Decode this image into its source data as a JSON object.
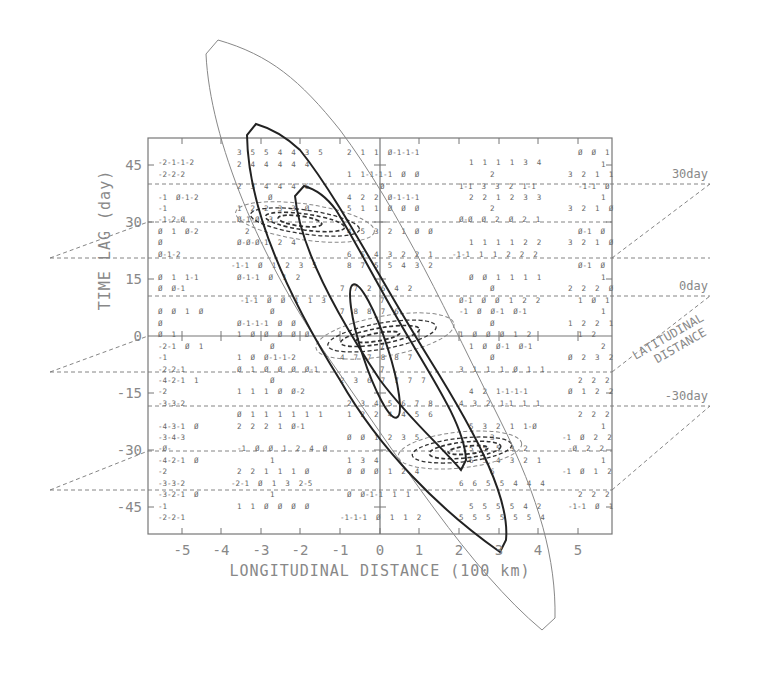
{
  "chart_data": {
    "type": "contour",
    "title": "",
    "xlabel": "LONGITUDINAL DISTANCE (100 km)",
    "ylabel": "TIME LAG (day)",
    "zlabel": "LATITUDINAL DISTANCE",
    "x_ticks": [
      "-5",
      "-4",
      "-3",
      "-2",
      "-1",
      "0",
      "1",
      "2",
      "3",
      "4",
      "5"
    ],
    "y_ticks": [
      "45",
      "30",
      "15",
      "0",
      "-15",
      "-30",
      "-45"
    ],
    "xlim": [
      -5.8,
      5.8
    ],
    "ylim": [
      -53,
      53
    ],
    "grid": false,
    "planes": [
      {
        "label": "30day",
        "time_lag": 30
      },
      {
        "label": "0day",
        "time_lag": 0
      },
      {
        "label": "-30day",
        "time_lag": -30
      }
    ],
    "contours": [
      {
        "name": "outer-thin",
        "style": "solid-thin",
        "description": "large elongated ellipse oriented from upper-left (-3.6, 80) to lower-right (3.8, -90)"
      },
      {
        "name": "middle-bold",
        "style": "solid-bold",
        "description": "bold ellipse from (-2.6, 55) to (3.0, -53)"
      },
      {
        "name": "inner-bold",
        "style": "solid-bold",
        "description": "bold ellipse from (-1.8, 36) to (2.2, -35)"
      },
      {
        "name": "core-bold",
        "style": "solid-bold",
        "description": "innermost ellipse from (-0.3, 15) to (1.0, -15)"
      },
      {
        "name": "dashed-30day",
        "style": "dashed",
        "description": "dashed concentric ellipses centered near (-1.3, 30) on 30-day plane"
      },
      {
        "name": "dashed-0day",
        "style": "dashed",
        "description": "dashed concentric ellipses centered near (0, 0) on 0-day plane"
      },
      {
        "name": "dashed-minus30day",
        "style": "dashed",
        "description": "dashed concentric ellipses centered near (1.5, -30) on -30-day plane"
      }
    ],
    "annotations": [
      {
        "x_pos": 1.8,
        "rows": [
          {
            "y": 46,
            "text": "3 5 5 4 4 3 5"
          },
          {
            "y": 42,
            "text": "2 4 4 4 4 4"
          }
        ]
      }
    ]
  },
  "labels": {
    "x_axis_title": "LONGITUDINAL DISTANCE (100 km)",
    "y_axis_title": "TIME LAG (day)",
    "z_axis_title_line1": "LATITUDINAL",
    "z_axis_title_line2": "DISTANCE",
    "plane_30": "30day",
    "plane_0": "0day",
    "plane_m30": "-30day"
  },
  "cells": [
    {
      "x": 158,
      "y": 165,
      "t": "-2-1-1-2"
    },
    {
      "x": 158,
      "y": 177,
      "t": "-2-2-2"
    },
    {
      "x": 158,
      "y": 200,
      "t": "-1  0-1-2"
    },
    {
      "x": 158,
      "y": 211,
      "t": "-1"
    },
    {
      "x": 158,
      "y": 222,
      "t": "-1-2-0"
    },
    {
      "x": 158,
      "y": 234,
      "t": "0  1  0-2"
    },
    {
      "x": 158,
      "y": 245,
      "t": "0"
    },
    {
      "x": 158,
      "y": 257,
      "t": "0-1-2"
    },
    {
      "x": 158,
      "y": 280,
      "t": "0  1  1-1"
    },
    {
      "x": 158,
      "y": 291,
      "t": "0  0-1"
    },
    {
      "x": 158,
      "y": 314,
      "t": "0  0  1  0"
    },
    {
      "x": 158,
      "y": 326,
      "t": "0"
    },
    {
      "x": 158,
      "y": 337,
      "t": "0  1"
    },
    {
      "x": 158,
      "y": 349,
      "t": "-2-1  0  1"
    },
    {
      "x": 158,
      "y": 360,
      "t": "-1"
    },
    {
      "x": 158,
      "y": 372,
      "t": "-2-2-1"
    },
    {
      "x": 158,
      "y": 383,
      "t": "-4-2-1  1"
    },
    {
      "x": 158,
      "y": 394,
      "t": "-2"
    },
    {
      "x": 158,
      "y": 406,
      "t": "-3-3-2"
    },
    {
      "x": 158,
      "y": 429,
      "t": "-4-3-1  0"
    },
    {
      "x": 158,
      "y": 440,
      "t": "-3-4-3"
    },
    {
      "x": 158,
      "y": 451,
      "t": "-0-"
    },
    {
      "x": 158,
      "y": 463,
      "t": "-4-2-1  0"
    },
    {
      "x": 158,
      "y": 474,
      "t": "-2"
    },
    {
      "x": 158,
      "y": 486,
      "t": "-3-3-2"
    },
    {
      "x": 158,
      "y": 497,
      "t": "-3-2-1  0"
    },
    {
      "x": 158,
      "y": 509,
      "t": "-1"
    },
    {
      "x": 158,
      "y": 520,
      "t": "-2-2-1"
    },
    {
      "x": 237,
      "y": 155,
      "t": "3  5  5  4  4  3  5"
    },
    {
      "x": 237,
      "y": 167,
      "t": "2  4  4  4  4  4"
    },
    {
      "x": 237,
      "y": 189,
      "t": "2  3  4  4  4  6"
    },
    {
      "x": 268,
      "y": 200,
      "t": "0"
    },
    {
      "x": 237,
      "y": 211,
      "t": "1  2  2  3  3  0"
    },
    {
      "x": 237,
      "y": 222,
      "t": "0-1-0  3"
    },
    {
      "x": 245,
      "y": 234,
      "t": "2"
    },
    {
      "x": 237,
      "y": 245,
      "t": "0-0-0-1  2  4"
    },
    {
      "x": 231,
      "y": 268,
      "t": "-1-1  0  1  2  3  5"
    },
    {
      "x": 237,
      "y": 280,
      "t": "0-1-1  0  1  2"
    },
    {
      "x": 240,
      "y": 303,
      "t": "-1-1  0  0  1  1  3"
    },
    {
      "x": 270,
      "y": 314,
      "t": "0"
    },
    {
      "x": 237,
      "y": 326,
      "t": "0-1-1-1  0  0"
    },
    {
      "x": 237,
      "y": 337,
      "t": "1  0  0  0  0  0"
    },
    {
      "x": 270,
      "y": 349,
      "t": "0"
    },
    {
      "x": 237,
      "y": 360,
      "t": "1  0  0-1-1-2"
    },
    {
      "x": 237,
      "y": 372,
      "t": "0  1  0  0  0  0-1"
    },
    {
      "x": 270,
      "y": 383,
      "t": "0"
    },
    {
      "x": 237,
      "y": 394,
      "t": "1  1  1  0  0-2"
    },
    {
      "x": 237,
      "y": 417,
      "t": "0  1  1  1  1  1  1"
    },
    {
      "x": 237,
      "y": 429,
      "t": "2  2  2  1  0-1"
    },
    {
      "x": 237,
      "y": 451,
      "t": "-1  0  0  1  2  4  0"
    },
    {
      "x": 270,
      "y": 463,
      "t": "1"
    },
    {
      "x": 237,
      "y": 474,
      "t": "2  2  1  1  1  0"
    },
    {
      "x": 231,
      "y": 486,
      "t": "-2-1  0  1  3  2-5"
    },
    {
      "x": 270,
      "y": 497,
      "t": "1"
    },
    {
      "x": 237,
      "y": 509,
      "t": "1  1  0  0  0  0"
    },
    {
      "x": 347,
      "y": 155,
      "t": "2  1  1  0-1-1-1"
    },
    {
      "x": 347,
      "y": 177,
      "t": "1  1-1-1-1  0  0"
    },
    {
      "x": 380,
      "y": 189,
      "t": "0"
    },
    {
      "x": 347,
      "y": 200,
      "t": "4  2  2  0-1-1-1"
    },
    {
      "x": 347,
      "y": 211,
      "t": "5  1  1  0  0  0"
    },
    {
      "x": 347,
      "y": 234,
      "t": "4  5  3  2  1  0  0"
    },
    {
      "x": 347,
      "y": 257,
      "t": "6  5  4  3  2  2  1"
    },
    {
      "x": 347,
      "y": 268,
      "t": "8  7  5  5  4  3  2"
    },
    {
      "x": 340,
      "y": 291,
      "t": "7  7  2  6  4  2"
    },
    {
      "x": 380,
      "y": 303,
      "t": "7"
    },
    {
      "x": 340,
      "y": 314,
      "t": "7  8  8  7  6"
    },
    {
      "x": 380,
      "y": 349,
      "t": "7"
    },
    {
      "x": 340,
      "y": 360,
      "t": "4  7  7  8  8  7"
    },
    {
      "x": 380,
      "y": 372,
      "t": "7"
    },
    {
      "x": 340,
      "y": 383,
      "t": "2  3  6  7  7  7  7"
    },
    {
      "x": 347,
      "y": 406,
      "t": "2  3  4  5  6  7  8"
    },
    {
      "x": 347,
      "y": 417,
      "t": "1  2  2  4  4  5  6"
    },
    {
      "x": 347,
      "y": 440,
      "t": "0  0  1  2  3  5"
    },
    {
      "x": 347,
      "y": 463,
      "t": "1  3  4"
    },
    {
      "x": 347,
      "y": 474,
      "t": "0  0  0  1  2  4"
    },
    {
      "x": 347,
      "y": 497,
      "t": "0  0-1-1  1  1"
    },
    {
      "x": 340,
      "y": 520,
      "t": "-1-1-1  0  1  1  2"
    },
    {
      "x": 469,
      "y": 165,
      "t": "1  1  1  1  3  4"
    },
    {
      "x": 490,
      "y": 177,
      "t": "2"
    },
    {
      "x": 459,
      "y": 189,
      "t": "1-1  3  3  2  1-1"
    },
    {
      "x": 469,
      "y": 200,
      "t": "2  2  1  2  3  3"
    },
    {
      "x": 490,
      "y": 211,
      "t": "2"
    },
    {
      "x": 459,
      "y": 222,
      "t": "0-0  0  2  0  2  1"
    },
    {
      "x": 469,
      "y": 245,
      "t": "1  1  1  1  2  2"
    },
    {
      "x": 452,
      "y": 257,
      "t": "-1-1  1  1  2  2  2"
    },
    {
      "x": 469,
      "y": 280,
      "t": "0  0  1  1  1  1"
    },
    {
      "x": 490,
      "y": 291,
      "t": "0"
    },
    {
      "x": 459,
      "y": 303,
      "t": "0-1  0  0  1  2  2"
    },
    {
      "x": 459,
      "y": 314,
      "t": "-1  0  0-1  0-1"
    },
    {
      "x": 490,
      "y": 326,
      "t": "0"
    },
    {
      "x": 459,
      "y": 337,
      "t": "1  0  0  0  1  2"
    },
    {
      "x": 469,
      "y": 349,
      "t": "1  0  0-1  0-1"
    },
    {
      "x": 490,
      "y": 360,
      "t": "0"
    },
    {
      "x": 459,
      "y": 372,
      "t": "3  1  1  1  0  1  1"
    },
    {
      "x": 469,
      "y": 394,
      "t": "4  2  1-1-1-1"
    },
    {
      "x": 459,
      "y": 406,
      "t": "4  3  2  1-1  1  1"
    },
    {
      "x": 469,
      "y": 429,
      "t": "5  3  2  1  1-0"
    },
    {
      "x": 490,
      "y": 440,
      "t": "3"
    },
    {
      "x": 469,
      "y": 451,
      "t": "5  5  5  3  2"
    },
    {
      "x": 469,
      "y": 463,
      "t": "6  5  4  3  2  1"
    },
    {
      "x": 490,
      "y": 474,
      "t": "6"
    },
    {
      "x": 459,
      "y": 486,
      "t": "6  6  5  5  4  4  4"
    },
    {
      "x": 469,
      "y": 509,
      "t": "5  5  5  5  4  2"
    },
    {
      "x": 459,
      "y": 520,
      "t": "5  5  5  5  5  5  4"
    },
    {
      "x": 578,
      "y": 155,
      "t": "0  0  1"
    },
    {
      "x": 601,
      "y": 167,
      "t": "1"
    },
    {
      "x": 568,
      "y": 177,
      "t": "3  2  1  1"
    },
    {
      "x": 578,
      "y": 189,
      "t": "-1-1  0"
    },
    {
      "x": 601,
      "y": 200,
      "t": "1"
    },
    {
      "x": 568,
      "y": 211,
      "t": "3  2  1  0"
    },
    {
      "x": 578,
      "y": 234,
      "t": "0-1  0"
    },
    {
      "x": 568,
      "y": 245,
      "t": "3  2  1  0"
    },
    {
      "x": 578,
      "y": 268,
      "t": "0-1  0"
    },
    {
      "x": 601,
      "y": 280,
      "t": "1"
    },
    {
      "x": 568,
      "y": 291,
      "t": "2  2  2  0"
    },
    {
      "x": 578,
      "y": 303,
      "t": "1  0  1"
    },
    {
      "x": 601,
      "y": 314,
      "t": "1"
    },
    {
      "x": 568,
      "y": 326,
      "t": "1  2  2  1"
    },
    {
      "x": 578,
      "y": 337,
      "t": "1  2"
    },
    {
      "x": 601,
      "y": 349,
      "t": "2"
    },
    {
      "x": 568,
      "y": 360,
      "t": "0  2  3  2"
    },
    {
      "x": 578,
      "y": 383,
      "t": "2  2  2"
    },
    {
      "x": 568,
      "y": 394,
      "t": "0  1  2  2"
    },
    {
      "x": 578,
      "y": 417,
      "t": "2  2  2"
    },
    {
      "x": 601,
      "y": 429,
      "t": "1"
    },
    {
      "x": 562,
      "y": 440,
      "t": "-1  0  2  2"
    },
    {
      "x": 568,
      "y": 451,
      "t": "-0  2  2"
    },
    {
      "x": 601,
      "y": 463,
      "t": "1"
    },
    {
      "x": 562,
      "y": 474,
      "t": "-1  0  1  2"
    },
    {
      "x": 578,
      "y": 497,
      "t": "2  2  2"
    },
    {
      "x": 568,
      "y": 509,
      "t": "-1-1  0  1"
    }
  ]
}
